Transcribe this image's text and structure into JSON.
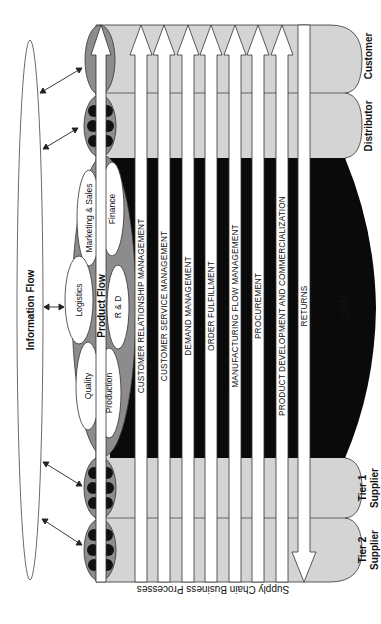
{
  "diagram": {
    "information_flow_label": "Information Flow",
    "product_flow_label": "Product Flow",
    "axis_label": "Supply Chain Business Processes",
    "entities": {
      "customer": "Customer",
      "distributor": "Distributor",
      "oem": "OEM",
      "tier1_line1": "Tier 1",
      "tier1_line2": "Supplier",
      "tier2_line1": "Tier 2",
      "tier2_line2": "Supplier"
    },
    "functions": {
      "marketing_sales": "Marketing & Sales",
      "finance": "Finance",
      "logistics": "Logistics",
      "rd": "R & D",
      "quality": "Quality",
      "production": "Production"
    },
    "processes": [
      "CUSTOMER RELATIONSHIP MANAGEMENT",
      "CUSTOMER SERVICE MANAGEMENT",
      "DEMAND MANAGEMENT",
      "ORDER FULFILLMENT",
      "MANUFACTURING FLOW MANAGEMENT",
      "PROCUREMENT",
      "PRODUCT DEVELOPMENT AND COMMERCIALIZATION",
      "RETURNS"
    ],
    "colors": {
      "light_gray": "#d4d4d4",
      "mid_gray": "#8c8c8c",
      "black": "#0a0a0a",
      "white": "#ffffff",
      "outline": "#333333"
    }
  }
}
